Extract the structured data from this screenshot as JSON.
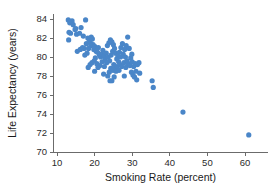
{
  "chart_data": {
    "type": "scatter",
    "title": "",
    "xlabel": "Smoking Rate (percent)",
    "ylabel": "Life Expectancy (years)",
    "xlim": [
      8.5,
      64
    ],
    "ylim": [
      70,
      85
    ],
    "xticks": [
      10,
      20,
      30,
      40,
      50,
      60
    ],
    "yticks": [
      70,
      72,
      74,
      76,
      78,
      80,
      82,
      84
    ],
    "xtick_labels": [
      "10",
      "20",
      "30",
      "40",
      "50",
      "60"
    ],
    "ytick_labels": [
      "70",
      "72",
      "74",
      "76",
      "78",
      "80",
      "82",
      "84"
    ],
    "grid": false,
    "legend": null,
    "marker_color": "#4a86c8",
    "marker_size": 2.6,
    "axis_color": "#6b6b6b",
    "points": [
      [
        13.0,
        83.9
      ],
      [
        13.4,
        83.6
      ],
      [
        14.0,
        83.8
      ],
      [
        14.3,
        83.4
      ],
      [
        13.2,
        82.6
      ],
      [
        13.6,
        82.5
      ],
      [
        14.8,
        82.9
      ],
      [
        15.2,
        82.4
      ],
      [
        13.1,
        81.8
      ],
      [
        15.0,
        83.0
      ],
      [
        16.0,
        82.5
      ],
      [
        16.4,
        83.1
      ],
      [
        17.6,
        83.9
      ],
      [
        17.0,
        82.2
      ],
      [
        15.4,
        80.6
      ],
      [
        16.2,
        80.8
      ],
      [
        17.2,
        80.9
      ],
      [
        17.8,
        81.4
      ],
      [
        18.2,
        82.0
      ],
      [
        18.6,
        81.8
      ],
      [
        18.9,
        81.5
      ],
      [
        19.1,
        82.1
      ],
      [
        19.4,
        81.9
      ],
      [
        19.0,
        81.2
      ],
      [
        19.6,
        81.3
      ],
      [
        18.4,
        80.9
      ],
      [
        18.0,
        80.4
      ],
      [
        17.4,
        80.2
      ],
      [
        19.8,
        80.8
      ],
      [
        20.1,
        81.1
      ],
      [
        20.4,
        80.6
      ],
      [
        20.8,
        80.5
      ],
      [
        21.0,
        81.0
      ],
      [
        21.3,
        80.2
      ],
      [
        20.2,
        79.9
      ],
      [
        19.9,
        79.6
      ],
      [
        19.3,
        79.4
      ],
      [
        18.8,
        79.2
      ],
      [
        18.3,
        78.9
      ],
      [
        20.6,
        79.3
      ],
      [
        21.6,
        80.0
      ],
      [
        21.9,
        80.3
      ],
      [
        22.2,
        80.7
      ],
      [
        22.5,
        80.1
      ],
      [
        22.0,
        79.5
      ],
      [
        21.4,
        79.1
      ],
      [
        20.9,
        78.9
      ],
      [
        22.8,
        79.7
      ],
      [
        23.1,
        80.4
      ],
      [
        23.4,
        81.2
      ],
      [
        23.8,
        81.5
      ],
      [
        24.2,
        81.8
      ],
      [
        24.6,
        81.6
      ],
      [
        25.0,
        81.3
      ],
      [
        23.6,
        80.0
      ],
      [
        23.2,
        79.4
      ],
      [
        22.6,
        79.0
      ],
      [
        24.0,
        79.6
      ],
      [
        24.4,
        80.2
      ],
      [
        24.8,
        80.6
      ],
      [
        25.3,
        80.9
      ],
      [
        25.6,
        80.4
      ],
      [
        25.9,
        79.8
      ],
      [
        25.1,
        79.2
      ],
      [
        24.3,
        78.8
      ],
      [
        23.9,
        78.4
      ],
      [
        23.5,
        78.0
      ],
      [
        24.9,
        78.6
      ],
      [
        25.4,
        79.0
      ],
      [
        26.2,
        80.1
      ],
      [
        26.6,
        80.5
      ],
      [
        27.0,
        81.0
      ],
      [
        27.4,
        81.4
      ],
      [
        26.9,
        80.0
      ],
      [
        26.4,
        79.5
      ],
      [
        26.0,
        79.0
      ],
      [
        25.7,
        78.5
      ],
      [
        25.2,
        77.9
      ],
      [
        24.6,
        77.5
      ],
      [
        26.8,
        79.2
      ],
      [
        27.6,
        80.3
      ],
      [
        28.0,
        80.8
      ],
      [
        28.4,
        81.2
      ],
      [
        28.8,
        82.1
      ],
      [
        28.2,
        80.0
      ],
      [
        27.8,
        79.4
      ],
      [
        27.2,
        79.0
      ],
      [
        26.5,
        78.6
      ],
      [
        28.6,
        79.6
      ],
      [
        29.2,
        80.9
      ],
      [
        29.6,
        79.9
      ],
      [
        29.0,
        79.3
      ],
      [
        28.3,
        78.9
      ],
      [
        29.4,
        79.1
      ],
      [
        30.0,
        79.5
      ],
      [
        30.4,
        79.0
      ],
      [
        30.8,
        79.3
      ],
      [
        29.8,
        78.4
      ],
      [
        30.2,
        78.1
      ],
      [
        31.0,
        78.5
      ],
      [
        31.4,
        79.2
      ],
      [
        31.8,
        79.4
      ],
      [
        30.6,
        77.9
      ],
      [
        31.2,
        77.6
      ],
      [
        32.0,
        78.3
      ],
      [
        35.3,
        77.5
      ],
      [
        35.6,
        76.8
      ],
      [
        43.5,
        74.2
      ],
      [
        61.0,
        71.8
      ],
      [
        16.8,
        81.0
      ],
      [
        20.0,
        78.5
      ],
      [
        22.4,
        78.2
      ],
      [
        27.9,
        78.0
      ],
      [
        24.1,
        77.5
      ],
      [
        29.9,
        80.3
      ]
    ]
  }
}
